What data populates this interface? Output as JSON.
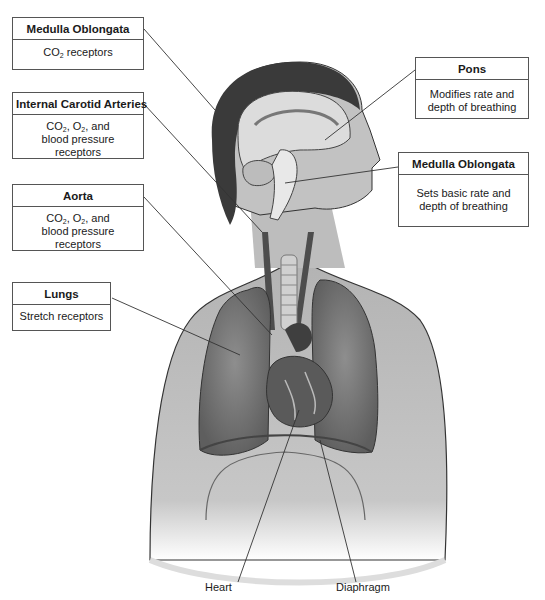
{
  "diagram": {
    "labels": [
      {
        "id": "medulla-top",
        "header": "Medulla Oblongata",
        "lines": [
          {
            "parts": [
              "CO",
              "2",
              " receptors"
            ]
          }
        ]
      },
      {
        "id": "internal-carotid",
        "header": "Internal Carotid Arteries",
        "lines": [
          {
            "parts": [
              "CO",
              "2",
              ", O",
              "2",
              ", and"
            ]
          },
          {
            "parts": [
              "blood pressure"
            ]
          },
          {
            "parts": [
              "receptors"
            ]
          }
        ]
      },
      {
        "id": "aorta",
        "header": "Aorta",
        "lines": [
          {
            "parts": [
              "CO",
              "2",
              ", O",
              "2",
              ", and"
            ]
          },
          {
            "parts": [
              "blood pressure"
            ]
          },
          {
            "parts": [
              "receptors"
            ]
          }
        ]
      },
      {
        "id": "lungs",
        "header": "Lungs",
        "lines": [
          {
            "parts": [
              "Stretch receptors"
            ]
          }
        ]
      },
      {
        "id": "pons",
        "header": "Pons",
        "lines": [
          {
            "parts": [
              "Modifies rate and"
            ]
          },
          {
            "parts": [
              "depth of breathing"
            ]
          }
        ]
      },
      {
        "id": "medulla-right",
        "header": "Medulla Oblongata",
        "lines": [
          {
            "parts": [
              "Sets basic rate and"
            ]
          },
          {
            "parts": [
              "depth of breathing"
            ]
          }
        ]
      }
    ],
    "plain_labels": {
      "heart": "Heart",
      "diaphragm": "Diaphragm"
    },
    "colors": {
      "line": "#333333",
      "box_border": "#555555",
      "skin": "#bdbdbd",
      "hair": "#3a3a3a",
      "lung": "#7d7d7d",
      "heart": "#5a5a5a"
    }
  }
}
